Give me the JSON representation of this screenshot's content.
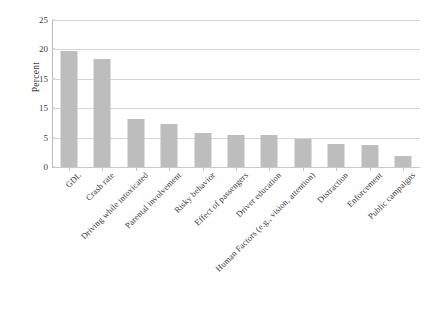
{
  "chart_data": {
    "type": "bar",
    "title": "",
    "xlabel": "",
    "ylabel": "Percent",
    "ylim": [
      0,
      25
    ],
    "yticks": [
      0,
      5,
      10,
      15,
      20,
      25
    ],
    "ytick_labels": [
      "0",
      "5",
      "15",
      "15",
      "20",
      "25"
    ],
    "grid": true,
    "legend": null,
    "bar_color": "#bdbdbd",
    "categories": [
      "GDL",
      "Crash rate",
      "Driving while intoxicated",
      "Parental involvement",
      "Risky behavior",
      "Effect of passengers",
      "Driver education",
      "Human Factors (e.g., vision, attention)",
      "Distraction",
      "Enforcement",
      "Public campaigns"
    ],
    "values": [
      19.8,
      18.4,
      8.1,
      7.3,
      5.8,
      5.5,
      5.4,
      4.7,
      3.9,
      3.7,
      1.8
    ]
  },
  "axes": {
    "y_title": "Percent"
  }
}
